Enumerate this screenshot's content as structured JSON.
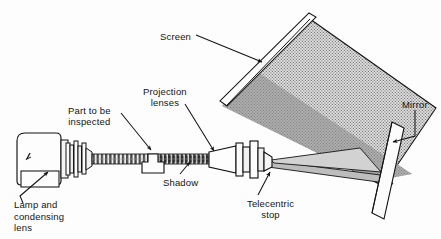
{
  "figure": {
    "type": "technical-line-diagram",
    "width": 441,
    "height": 239,
    "background_color": "#ffffff",
    "line_color": "#141414",
    "screen_fill_color": "#d9d9d9",
    "beam_fill_color": "#a8a8a8",
    "stipple_color": "#6e6e6e"
  },
  "labels": [
    {
      "id": "screen",
      "text": "Screen",
      "x": 160,
      "y": 31
    },
    {
      "id": "projection",
      "text": "Projection\nlenses",
      "x": 143,
      "y": 86
    },
    {
      "id": "part",
      "text": "Part to be\ninspected",
      "x": 68,
      "y": 105
    },
    {
      "id": "shadow",
      "text": "Shadow",
      "x": 163,
      "y": 177
    },
    {
      "id": "telecentric",
      "text": "Telecentric\nstop",
      "x": 247,
      "y": 198
    },
    {
      "id": "mirror",
      "text": "Mirror",
      "x": 402,
      "y": 99
    },
    {
      "id": "lamp",
      "text": "Lamp and\ncondensing\nlens",
      "x": 14,
      "y": 199
    }
  ],
  "components": [
    {
      "id": "lamp-housing",
      "name": "Lamp and condensing lens housing"
    },
    {
      "id": "condenser-stack",
      "name": "Condensing lens element stack"
    },
    {
      "id": "light-beam",
      "name": "Collimated light beam"
    },
    {
      "id": "part",
      "name": "Part to be inspected"
    },
    {
      "id": "shadow-band",
      "name": "Shadow of part in beam"
    },
    {
      "id": "projection-lens",
      "name": "Projection lens barrel"
    },
    {
      "id": "telecentric-stop",
      "name": "Telecentric stop flange"
    },
    {
      "id": "projected-cone",
      "name": "Projected diverging beam"
    },
    {
      "id": "mirror",
      "name": "Mirror"
    },
    {
      "id": "screen",
      "name": "Viewing screen"
    },
    {
      "id": "screen-frame",
      "name": "Screen frame edge bar"
    }
  ]
}
